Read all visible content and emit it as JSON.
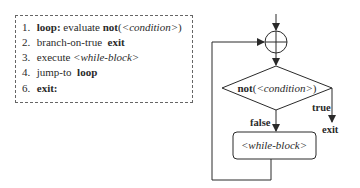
{
  "pseudocode": {
    "lines": [
      {
        "num": "1.",
        "kw": "loop:",
        "text": " evaluate ",
        "kw2": "not",
        "paren_open": "(",
        "italic": "<condition>",
        "paren_close": ")"
      },
      {
        "num": "2.",
        "text": "branch-on-true  ",
        "kw": "exit"
      },
      {
        "num": "3.",
        "text": "execute ",
        "italic": "<while-block>"
      },
      {
        "num": "4.",
        "text": "jump-to  ",
        "kw": "loop"
      },
      {
        "num": "6.",
        "kw": "exit:"
      }
    ]
  },
  "flowchart": {
    "decision": {
      "kw": "not",
      "open": "(",
      "italic": "<condition>",
      "close": ")"
    },
    "true_label": "true",
    "false_label": "false",
    "exit_label": "exit",
    "block_label": "<while-block>"
  }
}
